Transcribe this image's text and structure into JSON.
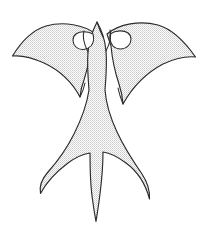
{
  "image": {
    "title": "Swallow Silhouette",
    "subject": "swallow-bird-in-flight",
    "style": "line-art-with-halftone-fill",
    "width": 208,
    "height": 237,
    "background_color": "#ffffff"
  },
  "palette": {
    "background": "#ffffff",
    "outline": "#2b2b2b",
    "fill_light": "#ffffff",
    "fill_dot": "#9a9a9a",
    "fill_average": "#e6e6e6",
    "hole_fill": "#ffffff"
  },
  "figure": {
    "name": "swallow",
    "parts": [
      {
        "id": "left-wing",
        "label": "Left Wing",
        "tip_x": 12,
        "tip_y": 56
      },
      {
        "id": "right-wing",
        "label": "Right Wing",
        "tip_x": 195,
        "tip_y": 57
      },
      {
        "id": "head",
        "label": "Head and Beak",
        "apex_x": 98,
        "apex_y": 18
      },
      {
        "id": "body",
        "label": "Body",
        "center_x": 97
      },
      {
        "id": "tail-left-streamer",
        "label": "Left Tail Streamer",
        "tip_x": 40,
        "tip_y": 194
      },
      {
        "id": "tail-center-spike",
        "label": "Center Tail Spike",
        "tip_x": 96,
        "tip_y": 222
      },
      {
        "id": "tail-right-streamer",
        "label": "Right Tail Streamer",
        "tip_x": 149,
        "tip_y": 200
      },
      {
        "id": "left-wing-root-eye",
        "label": "Left Wing Root Opening"
      },
      {
        "id": "right-wing-root-eye",
        "label": "Right Wing Root Opening"
      }
    ],
    "geometry": {
      "left_wing_path": "M 96 34 C 84 25 64 21 46 26 C 33 30 21 42 12.5 56 C 22 55 33 58 44 63 C 59 70 72 82 80 97 C 80.5 91 82 85 84 80 C 87 70 90 58 91 47 Z",
      "right_wing_path": "M 107 34 C 119 24 140 20 158 25 C 172 29 185 42 195.5 57 C 186 56 174 59 163 64 C 148 72 133 86 123 104 C 122.5 97 121 90 119 84 C 115 72 112 57 111 46 Z",
      "body_tail_path": "M 97 22 C 93 30 89 40 88 52 C 87 64 88 78 89 90 C 87 104 82 118 74 134 C 66 150 57 162 48 172 C 41 180 39 186 40.5 193.5 C 46 183 56 172 68 163 C 76 157 84 154 90 153 C 90 163 90 180 92 196 C 93.5 208 95 216 96 221.5 C 97 215 98.5 206 100 194 C 102 178 103 162 103 152 C 110 153 118 157 126 163 C 137 171 145 182 149.5 199 C 150 190 148 183 142 174 C 133 161 124 147 117 132 C 110 117 106 103 105 90 C 106 78 107 63 106 51 C 105 39 101 29 97 22 Z",
      "head_notch_path": "M 97 22 C 99 28 101 33 103 37",
      "left_eye_path": "M 93 34 C 87 31 80 31 76 34 C 72 37 72 43 76 47 C 80 51 87 50 91 46 C 93.5 43 94 38 93 34 Z",
      "right_eye_path": "M 110 34 C 116 30 124 30 128 33 C 132 36 132 42 128 46 C 124 50 117 50 113 46 C 110.5 43 109.5 38 110 34 Z",
      "neck_left_line": "M 88 52 C 84 44 82 37 84 31",
      "neck_right_line": "M 106 51 C 110 43 112 36 110 30",
      "wing_inner_left_line": "M 80 97 C 82 93 84 88 85 83",
      "wing_inner_right_line": "M 123 104 C 121 99 119 93 118 88"
    }
  }
}
